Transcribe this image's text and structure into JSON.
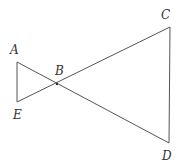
{
  "diagram": {
    "type": "geometry",
    "points": {
      "A": {
        "label": "A",
        "x": 17,
        "y": 62,
        "lx": 10,
        "ly": 54
      },
      "E": {
        "label": "E",
        "x": 17,
        "y": 102,
        "lx": 13,
        "ly": 119
      },
      "B": {
        "label": "B",
        "x": 57,
        "y": 84,
        "lx": 55,
        "ly": 75
      },
      "C": {
        "label": "C",
        "x": 170,
        "y": 27,
        "lx": 161,
        "ly": 19
      },
      "D": {
        "label": "D",
        "x": 169,
        "y": 143,
        "lx": 162,
        "ly": 160
      }
    },
    "segments": [
      [
        "A",
        "E"
      ],
      [
        "A",
        "D"
      ],
      [
        "E",
        "C"
      ],
      [
        "C",
        "D"
      ]
    ],
    "stroke_color": "#555555"
  }
}
